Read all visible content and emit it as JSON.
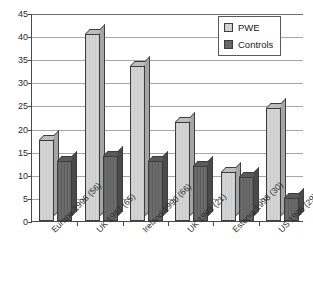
{
  "chart_data": {
    "type": "bar",
    "title": "",
    "subtitle": "",
    "xlabel": "",
    "ylabel": "",
    "ylim": [
      0,
      45
    ],
    "ytick_step": 5,
    "yticks": [
      0,
      5,
      10,
      15,
      20,
      25,
      30,
      35,
      40,
      45
    ],
    "grid": true,
    "legend_position": "top-right",
    "categories": [
      "Europe 1996 (56)",
      "UK 1987 (65)",
      "Ireland 1990 (66)",
      "UK 1993 (21)",
      "Estonia 1998 (30)",
      "US 1996 (29)"
    ],
    "series": [
      {
        "name": "PWE",
        "color": "#d0d0d0",
        "values": [
          17.5,
          40.5,
          33.5,
          21.5,
          10.5,
          24.5
        ]
      },
      {
        "name": "Controls",
        "color": "#636363",
        "values": [
          13,
          14,
          13,
          12,
          9.5,
          5
        ]
      }
    ]
  },
  "legend": {
    "items": [
      {
        "label": "PWE"
      },
      {
        "label": "Controls"
      }
    ]
  }
}
